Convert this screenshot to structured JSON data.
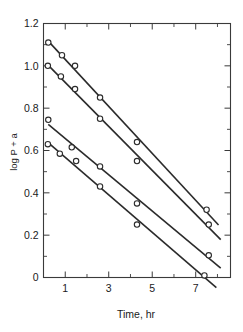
{
  "chart_data": {
    "type": "line",
    "title": "",
    "subtitle": "",
    "xlabel": "Time, hr",
    "ylabel": "log P + a",
    "xlim": [
      0,
      8.6
    ],
    "ylim": [
      0,
      1.2
    ],
    "grid": false,
    "legend_position": "none",
    "marker": "open-circle",
    "x_ticks_major": [
      1,
      3,
      5,
      7
    ],
    "x_ticks_major_labels": [
      "1",
      "3",
      "5",
      "7"
    ],
    "x_ticks_minor": [
      2,
      4,
      6,
      8
    ],
    "y_ticks_major": [
      0,
      0.2,
      0.4,
      0.6,
      0.8,
      1.0,
      1.2
    ],
    "y_ticks_major_labels": [
      "0",
      "0.2",
      "0.4",
      "0.6",
      "0.8",
      "1.0",
      "1.2"
    ],
    "y_ticks_minor": [
      0.1,
      0.3,
      0.5,
      0.7,
      0.9,
      1.1
    ],
    "series": [
      {
        "name": "series-1",
        "x": [
          0.22,
          0.85,
          1.45,
          2.6,
          4.3,
          7.5
        ],
        "values": [
          1.11,
          1.05,
          1.0,
          0.85,
          0.64,
          0.32
        ]
      },
      {
        "name": "series-2",
        "x": [
          0.2,
          0.8,
          1.45,
          2.6,
          4.3,
          7.6
        ],
        "values": [
          1.0,
          0.95,
          0.89,
          0.75,
          0.55,
          0.25
        ]
      },
      {
        "name": "series-3",
        "x": [
          0.22,
          1.3,
          2.6,
          4.3,
          7.6
        ],
        "values": [
          0.745,
          0.615,
          0.525,
          0.35,
          0.105
        ]
      },
      {
        "name": "series-4",
        "x": [
          0.2,
          0.75,
          1.5,
          2.6,
          4.3,
          7.4
        ],
        "values": [
          0.63,
          0.585,
          0.55,
          0.43,
          0.25,
          0.01
        ]
      }
    ]
  }
}
